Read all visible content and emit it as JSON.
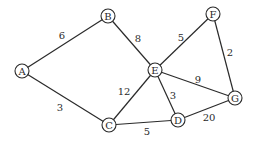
{
  "graph": {
    "nodes": [
      {
        "id": "A",
        "label": "A",
        "x": 22,
        "y": 71
      },
      {
        "id": "B",
        "label": "B",
        "x": 108,
        "y": 16
      },
      {
        "id": "C",
        "label": "C",
        "x": 109,
        "y": 125
      },
      {
        "id": "D",
        "label": "D",
        "x": 178,
        "y": 120
      },
      {
        "id": "E",
        "label": "E",
        "x": 155,
        "y": 70
      },
      {
        "id": "F",
        "label": "F",
        "x": 213,
        "y": 14
      },
      {
        "id": "G",
        "label": "G",
        "x": 235,
        "y": 98
      }
    ],
    "edges": [
      {
        "from": "A",
        "to": "B",
        "weight": "6",
        "lx": 62,
        "ly": 35
      },
      {
        "from": "A",
        "to": "C",
        "weight": "3",
        "lx": 60,
        "ly": 107
      },
      {
        "from": "B",
        "to": "E",
        "weight": "8",
        "lx": 138,
        "ly": 38
      },
      {
        "from": "C",
        "to": "E",
        "weight": "12",
        "lx": 124,
        "ly": 91
      },
      {
        "from": "C",
        "to": "D",
        "weight": "5",
        "lx": 147,
        "ly": 131
      },
      {
        "from": "E",
        "to": "F",
        "weight": "5",
        "lx": 181,
        "ly": 37
      },
      {
        "from": "E",
        "to": "D",
        "weight": "3",
        "lx": 173,
        "ly": 95
      },
      {
        "from": "E",
        "to": "G",
        "weight": "9",
        "lx": 198,
        "ly": 79
      },
      {
        "from": "F",
        "to": "G",
        "weight": "2",
        "lx": 230,
        "ly": 52
      },
      {
        "from": "D",
        "to": "G",
        "weight": "20",
        "lx": 209,
        "ly": 117
      }
    ],
    "node_radius": 7,
    "colors": {
      "stroke": "#2a2a2a",
      "background": "#ffffff"
    }
  }
}
